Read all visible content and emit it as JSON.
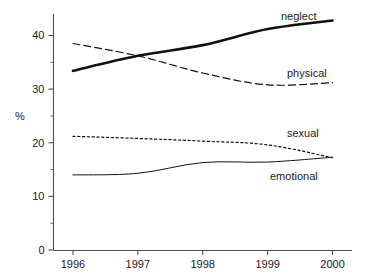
{
  "chart_data": {
    "type": "line",
    "title": "",
    "xlabel": "",
    "ylabel": "%",
    "x": [
      1996,
      1997,
      1998,
      1999,
      2000
    ],
    "xtick_labels": [
      "1996",
      "1997",
      "1998",
      "1999",
      "2000"
    ],
    "ytick_labels": [
      "0",
      "10",
      "20",
      "30",
      "40"
    ],
    "yticks": [
      0,
      10,
      20,
      30,
      40
    ],
    "yticks_minor": [
      5,
      15,
      25,
      35
    ],
    "ylim": [
      0,
      44
    ],
    "xlim": [
      1995.7,
      2000.3
    ],
    "grid": false,
    "legend_position": "inline-right-of-line-end",
    "series": [
      {
        "name": "neglect",
        "label": "neglect",
        "style": "solid-thick",
        "color": "#111111",
        "values": [
          33.4,
          36.2,
          38.2,
          41.2,
          42.8
        ]
      },
      {
        "name": "physical",
        "label": "physical",
        "style": "dashed",
        "color": "#333333",
        "values": [
          38.5,
          36.2,
          33.0,
          30.8,
          31.2
        ]
      },
      {
        "name": "sexual",
        "label": "sexual",
        "style": "dotted",
        "color": "#333333",
        "values": [
          21.2,
          20.8,
          20.3,
          19.6,
          17.2
        ]
      },
      {
        "name": "emotional",
        "label": "emotional",
        "style": "solid-thin",
        "color": "#555555",
        "values": [
          14.0,
          14.3,
          16.3,
          16.4,
          17.3
        ]
      }
    ]
  },
  "axis": {
    "y_title": "%",
    "x_tick_0": "1996",
    "x_tick_1": "1997",
    "x_tick_2": "1998",
    "x_tick_3": "1999",
    "x_tick_4": "2000",
    "y_tick_0": "0",
    "y_tick_1": "10",
    "y_tick_2": "20",
    "y_tick_3": "30",
    "y_tick_4": "40"
  },
  "labels": {
    "neglect": "neglect",
    "physical": "physical",
    "sexual": "sexual",
    "emotional": "emotional"
  }
}
